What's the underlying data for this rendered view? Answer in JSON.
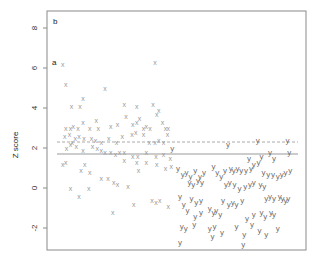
{
  "chart_data": {
    "type": "scatter",
    "title": "",
    "panel_label": "b",
    "annotation": "a",
    "xlabel": "",
    "ylabel": "Z score",
    "ylim": [
      -3.1,
      9.5
    ],
    "yticks": [
      -2,
      0,
      2,
      4,
      6,
      8
    ],
    "ytick_labels": [
      "-2",
      "0",
      "2",
      "4",
      "6",
      "8"
    ],
    "xticks": [],
    "grid": false,
    "legend": null,
    "reference_lines": [
      {
        "name": "dashed-threshold",
        "y": 2.3,
        "style": "dashed",
        "color": "#aaaaaa"
      },
      {
        "name": "solid-threshold",
        "y": 1.7,
        "style": "solid",
        "color": "#999999"
      }
    ],
    "series": [
      {
        "name": "x",
        "marker": "x",
        "color": "#9a9a9a",
        "points": [
          [
            0.6,
            6.2
          ],
          [
            0.9,
            5.2
          ],
          [
            1.5,
            4.1
          ],
          [
            2.4,
            4.1
          ],
          [
            2.7,
            4.5
          ],
          [
            5.0,
            5.0
          ],
          [
            10.2,
            6.3
          ],
          [
            8.3,
            4.1
          ],
          [
            7.0,
            4.2
          ],
          [
            10.0,
            4.2
          ],
          [
            10.6,
            3.9
          ],
          [
            0.9,
            3.0
          ],
          [
            1.4,
            3.0
          ],
          [
            1.7,
            3.1
          ],
          [
            2.2,
            3.0
          ],
          [
            2.7,
            3.3
          ],
          [
            3.4,
            3.0
          ],
          [
            4.1,
            3.4
          ],
          [
            4.3,
            3.0
          ],
          [
            5.6,
            3.1
          ],
          [
            6.3,
            3.2
          ],
          [
            7.2,
            3.6
          ],
          [
            7.9,
            3.2
          ],
          [
            8.3,
            3.3
          ],
          [
            8.6,
            3.5
          ],
          [
            9.0,
            3.0
          ],
          [
            9.3,
            3.1
          ],
          [
            9.7,
            3.0
          ],
          [
            10.4,
            3.7
          ],
          [
            11.0,
            3.3
          ],
          [
            11.3,
            3.0
          ],
          [
            11.6,
            3.0
          ],
          [
            0.8,
            2.6
          ],
          [
            1.3,
            2.7
          ],
          [
            1.6,
            2.3
          ],
          [
            1.9,
            2.5
          ],
          [
            2.3,
            2.6
          ],
          [
            2.8,
            2.5
          ],
          [
            3.6,
            2.5
          ],
          [
            4.0,
            2.4
          ],
          [
            4.6,
            2.3
          ],
          [
            5.4,
            2.5
          ],
          [
            6.2,
            2.3
          ],
          [
            6.8,
            2.6
          ],
          [
            7.8,
            2.7
          ],
          [
            8.2,
            2.8
          ],
          [
            9.0,
            2.7
          ],
          [
            9.6,
            2.3
          ],
          [
            10.2,
            2.3
          ],
          [
            10.6,
            2.4
          ],
          [
            11.1,
            2.3
          ],
          [
            11.5,
            2.7
          ],
          [
            1.0,
            2.0
          ],
          [
            1.4,
            2.2
          ],
          [
            2.0,
            2.1
          ],
          [
            2.7,
            1.9
          ],
          [
            3.7,
            2.1
          ],
          [
            4.2,
            2.0
          ],
          [
            4.6,
            1.9
          ],
          [
            5.0,
            1.8
          ],
          [
            5.6,
            1.8
          ],
          [
            6.1,
            1.7
          ],
          [
            6.5,
            1.8
          ],
          [
            7.0,
            1.8
          ],
          [
            7.9,
            1.6
          ],
          [
            8.4,
            1.6
          ],
          [
            9.3,
            1.8
          ],
          [
            10.3,
            1.6
          ],
          [
            11.1,
            1.7
          ],
          [
            11.8,
            1.5
          ],
          [
            0.6,
            1.2
          ],
          [
            0.9,
            1.3
          ],
          [
            2.5,
            0.9
          ],
          [
            2.9,
            1.2
          ],
          [
            3.4,
            0.8
          ],
          [
            4.6,
            0.5
          ],
          [
            5.3,
            0.5
          ],
          [
            5.9,
            0.3
          ],
          [
            6.3,
            0.2
          ],
          [
            7.0,
            1.4
          ],
          [
            8.3,
            1.3
          ],
          [
            8.5,
            0.9
          ],
          [
            9.3,
            1.3
          ],
          [
            10.4,
            1.2
          ],
          [
            11.3,
            1.0
          ],
          [
            11.9,
            1.1
          ],
          [
            1.4,
            0.0
          ],
          [
            2.3,
            -0.4
          ],
          [
            3.3,
            0.0
          ],
          [
            7.4,
            0.1
          ],
          [
            8.0,
            -0.8
          ],
          [
            9.9,
            -0.6
          ],
          [
            10.3,
            -0.7
          ],
          [
            10.7,
            -0.6
          ],
          [
            5.8,
            -1.2
          ],
          [
            11.6,
            -0.9
          ]
        ]
      },
      {
        "name": "y",
        "marker": "y",
        "color": "#6e6e6e",
        "points": [
          [
            12.0,
            2.0
          ],
          [
            20.9,
            2.4
          ],
          [
            24.0,
            2.4
          ],
          [
            17.8,
            2.2
          ],
          [
            21.3,
            1.6
          ],
          [
            22.2,
            1.8
          ],
          [
            24.2,
            1.8
          ],
          [
            20.0,
            1.5
          ],
          [
            22.6,
            1.5
          ],
          [
            20.5,
            1.2
          ],
          [
            21.0,
            1.3
          ],
          [
            12.6,
            1.0
          ],
          [
            13.1,
            0.7
          ],
          [
            13.5,
            0.8
          ],
          [
            13.9,
            0.6
          ],
          [
            14.4,
            0.9
          ],
          [
            14.9,
            0.6
          ],
          [
            15.3,
            0.8
          ],
          [
            16.3,
            1.1
          ],
          [
            16.7,
            0.8
          ],
          [
            17.1,
            0.6
          ],
          [
            17.5,
            0.9
          ],
          [
            18.1,
            1.0
          ],
          [
            18.4,
            0.9
          ],
          [
            18.8,
            1.0
          ],
          [
            19.2,
            0.9
          ],
          [
            19.7,
            0.9
          ],
          [
            20.2,
            1.0
          ],
          [
            21.5,
            0.8
          ],
          [
            22.0,
            0.7
          ],
          [
            22.5,
            0.7
          ],
          [
            23.0,
            0.6
          ],
          [
            23.4,
            0.7
          ],
          [
            23.8,
            0.8
          ],
          [
            24.3,
            0.9
          ],
          [
            13.8,
            0.3
          ],
          [
            14.2,
            0.2
          ],
          [
            14.7,
            0.4
          ],
          [
            15.1,
            0.3
          ],
          [
            17.6,
            0.2
          ],
          [
            18.0,
            0.3
          ],
          [
            18.5,
            0.2
          ],
          [
            19.0,
            0.0
          ],
          [
            19.6,
            0.1
          ],
          [
            20.1,
            0.2
          ],
          [
            20.5,
            0.3
          ],
          [
            21.2,
            0.2
          ],
          [
            21.6,
            0.1
          ],
          [
            12.8,
            -0.4
          ],
          [
            13.2,
            -0.8
          ],
          [
            14.0,
            -0.5
          ],
          [
            14.5,
            -0.7
          ],
          [
            15.0,
            -0.6
          ],
          [
            17.3,
            -0.6
          ],
          [
            17.9,
            -0.8
          ],
          [
            18.3,
            -0.7
          ],
          [
            18.7,
            -0.8
          ],
          [
            19.3,
            -0.6
          ],
          [
            21.8,
            -0.5
          ],
          [
            22.2,
            -0.4
          ],
          [
            22.6,
            -0.5
          ],
          [
            23.2,
            -0.4
          ],
          [
            23.5,
            -0.5
          ],
          [
            23.8,
            -0.6
          ],
          [
            24.1,
            -0.5
          ],
          [
            13.6,
            -1.1
          ],
          [
            14.4,
            -1.4
          ],
          [
            15.0,
            -1.2
          ],
          [
            15.9,
            -1.0
          ],
          [
            16.3,
            -1.2
          ],
          [
            16.6,
            -1.1
          ],
          [
            17.0,
            -1.3
          ],
          [
            19.8,
            -1.5
          ],
          [
            20.5,
            -1.3
          ],
          [
            21.3,
            -1.2
          ],
          [
            21.7,
            -1.4
          ],
          [
            22.3,
            -1.2
          ],
          [
            22.6,
            -1.3
          ],
          [
            13.0,
            -1.9
          ],
          [
            13.4,
            -2.0
          ],
          [
            14.3,
            -1.8
          ],
          [
            15.9,
            -2.0
          ],
          [
            16.4,
            -1.9
          ],
          [
            17.2,
            -2.2
          ],
          [
            18.7,
            -1.9
          ],
          [
            19.5,
            -2.3
          ],
          [
            20.3,
            -1.8
          ],
          [
            21.1,
            -2.1
          ],
          [
            21.8,
            -2.3
          ],
          [
            23.0,
            -2.0
          ],
          [
            12.8,
            -2.7
          ],
          [
            16.2,
            -2.4
          ],
          [
            19.4,
            -2.8
          ]
        ]
      }
    ]
  }
}
